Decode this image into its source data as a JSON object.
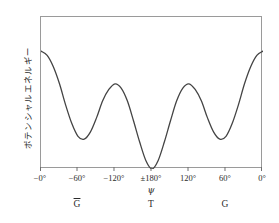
{
  "figure": {
    "y_axis_label": "ポテンシャルエネルギー",
    "x_axis_symbol": "ψ",
    "line_color": "#444444",
    "frame_color": "#9a9a9a",
    "background_color": "#ffffff"
  },
  "x_ticks": [
    {
      "label": "−0°",
      "pos_pct": 0
    },
    {
      "label": "−60°",
      "pos_pct": 16.6667
    },
    {
      "label": "−120°",
      "pos_pct": 33.3333
    },
    {
      "label": "±180°",
      "pos_pct": 50
    },
    {
      "label": "120°",
      "pos_pct": 66.6667
    },
    {
      "label": "60°",
      "pos_pct": 83.3333
    },
    {
      "label": "0°",
      "pos_pct": 100
    }
  ],
  "conformers": [
    {
      "label": "G",
      "overbar": true,
      "pos_pct": 16.6667
    },
    {
      "label": "T",
      "overbar": false,
      "pos_pct": 50
    },
    {
      "label": "G",
      "overbar": false,
      "pos_pct": 83.3333
    }
  ],
  "chart_data": {
    "type": "line",
    "title": "",
    "xlabel": "ψ",
    "ylabel": "ポテンシャルエネルギー",
    "xlim": [
      0,
      360
    ],
    "ylim": [
      0,
      1
    ],
    "grid": false,
    "legend": null,
    "x_tick_values": [
      0,
      60,
      120,
      180,
      240,
      300,
      360
    ],
    "x_tick_labels": [
      "−0°",
      "−60°",
      "−120°",
      "±180°",
      "120°",
      "60°",
      "0°"
    ],
    "annotations": [
      {
        "text": "G",
        "overbar": true,
        "x": 60,
        "note": "gauche-minus minimum"
      },
      {
        "text": "T",
        "overbar": false,
        "x": 180,
        "note": "trans global minimum"
      },
      {
        "text": "G",
        "overbar": false,
        "x": 300,
        "note": "gauche-plus minimum"
      }
    ],
    "series": [
      {
        "name": "torsional potential energy",
        "x": [
          0,
          10,
          20,
          30,
          40,
          50,
          60,
          70,
          80,
          90,
          100,
          110,
          120,
          130,
          140,
          150,
          160,
          170,
          180,
          190,
          200,
          210,
          220,
          230,
          240,
          250,
          260,
          270,
          280,
          290,
          300,
          310,
          320,
          330,
          340,
          350,
          360
        ],
        "values": [
          0.83,
          0.8,
          0.72,
          0.6,
          0.45,
          0.32,
          0.23,
          0.21,
          0.26,
          0.36,
          0.48,
          0.56,
          0.6,
          0.57,
          0.48,
          0.34,
          0.19,
          0.06,
          0.0,
          0.06,
          0.19,
          0.34,
          0.48,
          0.57,
          0.6,
          0.56,
          0.48,
          0.36,
          0.26,
          0.21,
          0.23,
          0.32,
          0.45,
          0.6,
          0.72,
          0.8,
          0.83
        ]
      }
    ],
    "critical_points": {
      "global_minima": [
        {
          "x": 180,
          "y": 0.0,
          "label": "T"
        }
      ],
      "local_minima": [
        {
          "x": 65,
          "y": 0.205,
          "label": "G-bar"
        },
        {
          "x": 295,
          "y": 0.205,
          "label": "G"
        }
      ],
      "local_maxima": [
        {
          "x": 120,
          "y": 0.6
        },
        {
          "x": 240,
          "y": 0.6
        }
      ],
      "edge_maxima": [
        {
          "x": 0,
          "y": 0.83
        },
        {
          "x": 360,
          "y": 0.83
        }
      ]
    }
  }
}
